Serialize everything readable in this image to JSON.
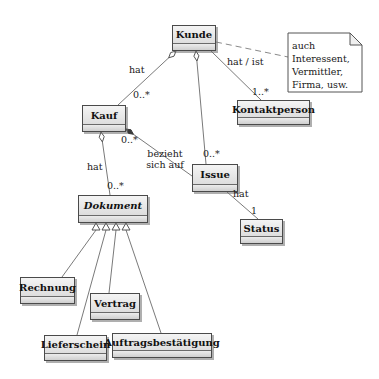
{
  "diagram_title": "UML class diagram",
  "colors": {
    "background": "#ffffff",
    "box_fill_top": "#f4f4f4",
    "box_fill_bottom": "#d5d5d5",
    "box_border": "#4a4a4a",
    "line": "#7a7a7a"
  },
  "classes": {
    "kunde": {
      "name": "Kunde"
    },
    "kontaktperson": {
      "name": "Kontaktperson"
    },
    "kauf": {
      "name": "Kauf"
    },
    "issue": {
      "name": "Issue"
    },
    "status": {
      "name": "Status"
    },
    "dokument": {
      "name": "Dokument",
      "abstract": true
    },
    "rechnung": {
      "name": "Rechnung"
    },
    "vertrag": {
      "name": "Vertrag"
    },
    "lieferschein": {
      "name": "Lieferschein"
    },
    "auftragsbestaetigung": {
      "name": "Auftragsbestätigung"
    }
  },
  "note": {
    "lines": [
      "auch",
      "Interessent,",
      "Vermittler,",
      "Firma, usw."
    ]
  },
  "relations": {
    "kunde_kauf": {
      "from": "Kunde",
      "to": "Kauf",
      "type": "aggregation",
      "label": "hat",
      "multiplicity": "0..*"
    },
    "kunde_issue": {
      "from": "Kunde",
      "to": "Issue",
      "type": "aggregation",
      "multiplicity": "0..*"
    },
    "kunde_kontaktperson": {
      "from": "Kunde",
      "to": "Kontaktperson",
      "type": "association",
      "label": "hat / ist",
      "multiplicity": "1..*"
    },
    "kauf_issue": {
      "from": "Kauf",
      "to": "Issue",
      "type": "association",
      "label": "bezieht sich auf",
      "multiplicity": "0..*"
    },
    "kauf_dokument": {
      "from": "Kauf",
      "to": "Dokument",
      "type": "aggregation",
      "label": "hat",
      "multiplicity": "0..*"
    },
    "issue_status": {
      "from": "Issue",
      "to": "Status",
      "type": "association",
      "label": "hat",
      "multiplicity": "1"
    },
    "dokument_generalization": {
      "superclass": "Dokument",
      "type": "generalization",
      "subclasses": [
        "Rechnung",
        "Vertrag",
        "Lieferschein",
        "Auftragsbestätigung"
      ]
    },
    "kunde_note": {
      "from": "Kunde",
      "to": "note",
      "type": "note-link"
    }
  }
}
